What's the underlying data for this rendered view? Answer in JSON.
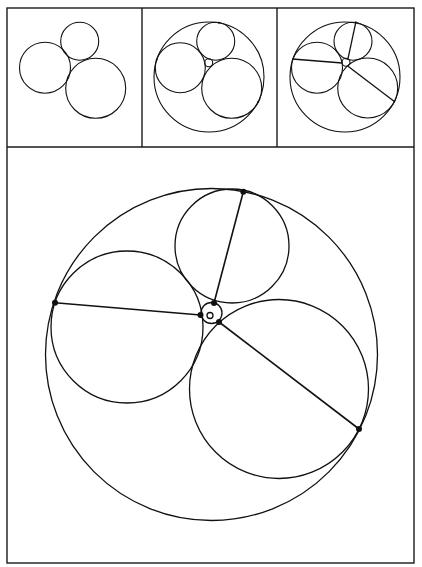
{
  "figure": {
    "width": 422,
    "height": 567,
    "stroke_color": "#111111",
    "background": "#ffffff",
    "frame": {
      "outer": {
        "x": 7,
        "y": 8,
        "w": 407,
        "h": 555
      },
      "top_row_bottom_y": 147,
      "dividers_x": [
        142,
        277
      ]
    },
    "panels": [
      {
        "id": "panel-1-three-tangent-circles",
        "circles": [
          {
            "name": "top-circle",
            "cx": 79.7,
            "cy": 41.3,
            "r": 19
          },
          {
            "name": "left-circle",
            "cx": 45,
            "cy": 67.7,
            "r": 25.5
          },
          {
            "name": "bottom-right-circle",
            "cx": 95.7,
            "cy": 88.3,
            "r": 30
          }
        ],
        "segments": [],
        "dots": []
      },
      {
        "id": "panel-2-inner-and-outer-soddy-circles",
        "circles": [
          {
            "name": "outer-circle",
            "cx": 209,
            "cy": 77,
            "r": 55
          },
          {
            "name": "top-circle",
            "cx": 215.7,
            "cy": 41.3,
            "r": 19
          },
          {
            "name": "left-circle",
            "cx": 180.3,
            "cy": 67.7,
            "r": 25
          },
          {
            "name": "bottom-right-circle",
            "cx": 231.7,
            "cy": 88.3,
            "r": 30
          },
          {
            "name": "inner-circle",
            "cx": 208.7,
            "cy": 62.7,
            "r": 4
          }
        ],
        "segments": [],
        "dots": [
          {
            "x": 219,
            "y": 22.7,
            "r": 1
          },
          {
            "x": 156.7,
            "y": 59.7,
            "r": 1
          },
          {
            "x": 258,
            "y": 102,
            "r": 1
          }
        ]
      },
      {
        "id": "panel-3-with-connecting-lines",
        "circles": [
          {
            "name": "outer-circle",
            "cx": 345,
            "cy": 77,
            "r": 55
          },
          {
            "name": "top-circle",
            "cx": 353,
            "cy": 41.3,
            "r": 19
          },
          {
            "name": "left-circle",
            "cx": 317,
            "cy": 67.7,
            "r": 25.5
          },
          {
            "name": "bottom-right-circle",
            "cx": 367.7,
            "cy": 88,
            "r": 30
          },
          {
            "name": "inner-circle",
            "cx": 346,
            "cy": 62.3,
            "r": 4
          }
        ],
        "segments": [
          {
            "x1": 356,
            "y1": 21.3,
            "x2": 348,
            "y2": 58.7
          },
          {
            "x1": 292.3,
            "y1": 59,
            "x2": 342.3,
            "y2": 63
          },
          {
            "x1": 348,
            "y1": 66.3,
            "x2": 395,
            "y2": 102
          }
        ],
        "dots": []
      },
      {
        "id": "panel-main-enlarged-construction",
        "main": true,
        "circles": [
          {
            "name": "outer-circle",
            "cx": 211.5,
            "cy": 354.5,
            "r": 166
          },
          {
            "name": "top-circle",
            "cx": 232,
            "cy": 246,
            "r": 57
          },
          {
            "name": "left-circle",
            "cx": 127,
            "cy": 327,
            "r": 76
          },
          {
            "name": "bottom-right-circle",
            "cx": 279,
            "cy": 389,
            "r": 89.5
          },
          {
            "name": "inner-soddy-circle",
            "cx": 211.5,
            "cy": 313,
            "r": 10.5
          },
          {
            "name": "tiny-center-circle",
            "cx": 210,
            "cy": 315.5,
            "r": 3
          }
        ],
        "segments": [
          {
            "x1": 243.3,
            "y1": 191.7,
            "x2": 214,
            "y2": 303
          },
          {
            "x1": 55,
            "y1": 302.7,
            "x2": 200.5,
            "y2": 315
          },
          {
            "x1": 219,
            "y1": 322,
            "x2": 359,
            "y2": 429
          }
        ],
        "dots": [
          {
            "x": 243.3,
            "y": 191.7,
            "r": 3
          },
          {
            "x": 55,
            "y": 302.7,
            "r": 3
          },
          {
            "x": 359,
            "y": 429,
            "r": 3
          },
          {
            "x": 214,
            "y": 303,
            "r": 3
          },
          {
            "x": 200.5,
            "y": 315,
            "r": 3
          },
          {
            "x": 219,
            "y": 322,
            "r": 3
          }
        ]
      }
    ]
  }
}
